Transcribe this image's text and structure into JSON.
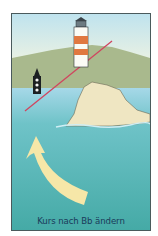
{
  "diagram": {
    "caption": "Kurs nach Bb ändern",
    "elements": {
      "lighthouse": "lighthouse-icon",
      "buoy": "beacon-buoy-icon",
      "bearing_line": "red bearing line",
      "rock": "rock-island",
      "arrow": "turn-to-port-arrow"
    },
    "colors": {
      "sky_top": "#bfe3ee",
      "sky_bottom": "#f6f5e0",
      "hill": "#a9b98d",
      "water_near": "#a6d8e8",
      "water_far": "#4fb3b0",
      "rock": "#efe6c2",
      "arrow": "#f6e7a8",
      "line": "#d0455f",
      "caption": "#1a3a5a"
    }
  }
}
